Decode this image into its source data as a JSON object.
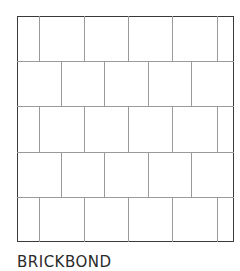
{
  "title": "BRICKBOND",
  "pattern": {
    "name": "brickbond",
    "frame": {
      "x": 17,
      "y": 16,
      "width": 217,
      "height": 226
    },
    "rows": 5,
    "row_boundaries_y": [
      16,
      61,
      106,
      152,
      197,
      242
    ],
    "odd_row_joints_x": [
      39,
      84,
      128,
      172,
      217
    ],
    "even_row_joints_x": [
      61,
      104,
      148,
      191
    ],
    "line_color": "#9a9a9a",
    "frame_color": "#3a3a3a"
  }
}
